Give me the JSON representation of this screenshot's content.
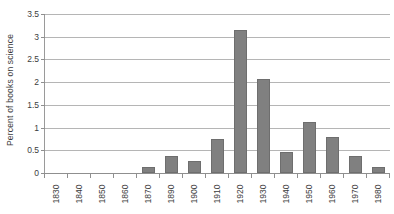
{
  "chart_data": {
    "type": "bar",
    "title": "",
    "xlabel": "",
    "ylabel": "Percent of books on science",
    "categories": [
      "1830",
      "1840",
      "1850",
      "1860",
      "1870",
      "1890",
      "1900",
      "1910",
      "1920",
      "1930",
      "1940",
      "1950",
      "1960",
      "1970",
      "1980"
    ],
    "values": [
      0,
      0,
      0,
      0,
      0.13,
      0.37,
      0.26,
      0.74,
      3.15,
      2.07,
      0.47,
      1.12,
      0.8,
      0.38,
      0.13
    ],
    "ylim": [
      0,
      3.5
    ],
    "yticks": [
      "0",
      "0.5",
      "1",
      "1.5",
      "2",
      "2.5",
      "3",
      "3.5"
    ],
    "ytick_values": [
      0,
      0.5,
      1,
      1.5,
      2,
      2.5,
      3,
      3.5
    ],
    "grid": true,
    "legend": false,
    "legend_position": "none",
    "bar_color": "#808080",
    "bar_edge_color": "#6e6e6e",
    "grid_color": "#b5b5b5",
    "axis_color": "#8f8f8f",
    "background_color": "#ffffff",
    "text_color": "#3c3c3c"
  }
}
